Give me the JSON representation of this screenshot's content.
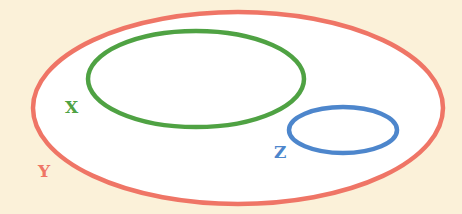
{
  "diagram": {
    "type": "venn-subset",
    "background": "#fbf1d9",
    "sets": [
      {
        "id": "Y",
        "label": "Y",
        "color": "#ef7566",
        "fill": "#ffffff",
        "cx": 238,
        "cy": 108,
        "rx": 205,
        "ry": 96,
        "label_x": 38,
        "label_y": 177
      },
      {
        "id": "X",
        "label": "X",
        "color": "#4fa243",
        "fill": "none",
        "cx": 196,
        "cy": 79,
        "rx": 108,
        "ry": 48,
        "label_x": 65,
        "label_y": 113
      },
      {
        "id": "Z",
        "label": "Z",
        "color": "#4d86cc",
        "fill": "none",
        "cx": 343,
        "cy": 130,
        "rx": 54,
        "ry": 23,
        "label_x": 274,
        "label_y": 158
      }
    ],
    "relationships": [
      "X ⊂ Y",
      "Z ⊂ Y",
      "X ∩ Z = ∅"
    ]
  }
}
